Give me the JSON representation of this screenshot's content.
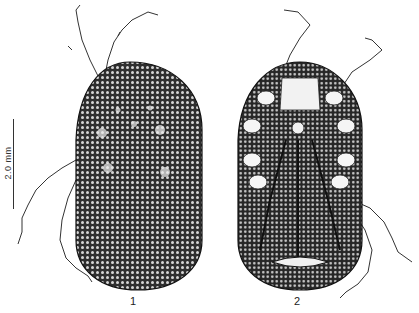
{
  "figure": {
    "scale_bar": {
      "label": "2.0 mm"
    },
    "panels": [
      {
        "id": "1",
        "label": "1",
        "view": "dorsal"
      },
      {
        "id": "2",
        "label": "2",
        "view": "ventral"
      }
    ],
    "colors": {
      "background": "#ffffff",
      "ink": "#222222",
      "body_fill": "#3a3a3a",
      "granule": "#d8d8d8"
    }
  }
}
